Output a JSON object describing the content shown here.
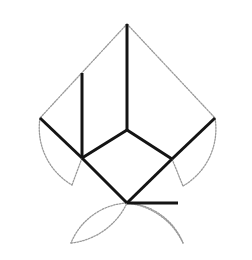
{
  "figure": {
    "canvas": {
      "width": 252,
      "height": 260,
      "background": "#ffffff"
    },
    "colors": {
      "bold_line": "#141414",
      "light_line": "#9a9a9a",
      "background": "#ffffff"
    },
    "stroke_widths": {
      "bold": 3.0,
      "light": 1.3
    },
    "dash_pattern": "1.6 1.4",
    "vertices": {
      "apex": {
        "x": 127,
        "y": 24,
        "label": "apex"
      },
      "center_top": {
        "x": 127,
        "y": 130,
        "label": "center-top"
      },
      "left_mid": {
        "x": 82,
        "y": 158,
        "label": "left-middle"
      },
      "right_mid": {
        "x": 172,
        "y": 159,
        "label": "right-middle"
      },
      "left_outer": {
        "x": 40,
        "y": 118,
        "label": "left-outer"
      },
      "right_outer": {
        "x": 215,
        "y": 118,
        "label": "right-outer"
      },
      "bottom": {
        "x": 127,
        "y": 203,
        "label": "bottom"
      },
      "upper_left_stem": {
        "x": 82,
        "y": 73,
        "label": "upper-left-stem-top"
      },
      "right_tail": {
        "x": 178,
        "y": 203,
        "label": "right-tail-end"
      },
      "left_arc_end": {
        "x": 72,
        "y": 185,
        "label": "left-arc-end"
      },
      "right_arc_end": {
        "x": 183,
        "y": 186,
        "label": "right-arc-end"
      },
      "bottom_left_arc_end": {
        "x": 71,
        "y": 243,
        "label": "bottom-left-arc-end"
      },
      "bottom_right_arc_end": {
        "x": 183,
        "y": 243,
        "label": "bottom-right-arc-end"
      }
    },
    "bold_segments": [
      {
        "name": "apex-vertical",
        "d": "M 127 24 L 127 130"
      },
      {
        "name": "center-to-left-mid",
        "d": "M 127 130 L 82 158"
      },
      {
        "name": "center-to-right-mid",
        "d": "M 127 130 L 172 159"
      },
      {
        "name": "left-stem-vertical",
        "d": "M 82 73 L 82 158"
      },
      {
        "name": "left-outer-to-left-mid",
        "d": "M 40 118 L 82 158"
      },
      {
        "name": "right-outer-to-right-mid",
        "d": "M 215 118 L 172 159"
      },
      {
        "name": "left-mid-to-bottom",
        "d": "M 82 158 L 127 203"
      },
      {
        "name": "right-mid-to-bottom",
        "d": "M 172 159 L 127 203"
      },
      {
        "name": "bottom-horizontal-tail",
        "d": "M 127 203 L 178 203"
      }
    ],
    "light_segments": [
      {
        "name": "apex-to-left-outer",
        "d": "M 127 24 L 40 118"
      },
      {
        "name": "apex-to-right-outer",
        "d": "M 127 24 L 215 118"
      },
      {
        "name": "left-mid-to-left-arc-end",
        "d": "M 82 158 L 72 185"
      },
      {
        "name": "right-mid-to-right-arc-end",
        "d": "M 172 159 L 183 186"
      }
    ],
    "light_arcs": [
      {
        "name": "left-outer-arc",
        "d": "M 40 118 A 66 66 0 0 0 72 185",
        "note": "bulges to the left"
      },
      {
        "name": "right-outer-arc",
        "d": "M 215 118 A 66 66 0 0 1 183 186",
        "note": "bulges to the right"
      },
      {
        "name": "bottom-left-arc",
        "d": "M 127 203 A 64 64 0 0 0 71 243",
        "note": "bulges down-left"
      },
      {
        "name": "bottom-right-arc",
        "d": "M 127 203 A 64 64 0 0 1 183 243",
        "note": "bulges down-right"
      },
      {
        "name": "bottom-left-closing-arc",
        "d": "M 71 243 A 70 70 0 0 0 127 203",
        "note": "returns up to bottom vertex"
      },
      {
        "name": "bottom-right-closing-arc",
        "d": "M 183 243 A 70 70 0 0 0 127 203",
        "note": "returns up to bottom vertex"
      }
    ]
  }
}
